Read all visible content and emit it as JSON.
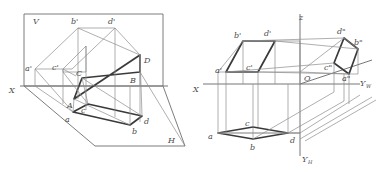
{
  "figure": {
    "type": "engineering-projection-drawing",
    "panels": [
      {
        "id": "left",
        "name": "pictorial-two-plane-projection",
        "description": "Pictorial view of the V (frontal) and H (horizontal) projection planes with the spatial quadrilateral and its projections",
        "plane_labels": [
          {
            "id": "V",
            "text": "V",
            "x": 33,
            "y": 20
          },
          {
            "id": "H",
            "text": "H",
            "x": 170,
            "y": 140
          },
          {
            "id": "X",
            "text": "X",
            "x": 11,
            "y": 90
          }
        ],
        "points": [
          {
            "id": "a-prime",
            "text": "a'",
            "x": 28,
            "y": 68
          },
          {
            "id": "b-prime",
            "text": "b'",
            "x": 74,
            "y": 21
          },
          {
            "id": "c-prime",
            "text": "c'",
            "x": 55,
            "y": 67
          },
          {
            "id": "d-prime",
            "text": "d'",
            "x": 110,
            "y": 21
          },
          {
            "id": "A",
            "text": "A",
            "x": 69,
            "y": 105
          },
          {
            "id": "B",
            "text": "B",
            "x": 130,
            "y": 80
          },
          {
            "id": "C",
            "text": "C",
            "x": 77,
            "y": 72
          },
          {
            "id": "D",
            "text": "D",
            "x": 144,
            "y": 60
          },
          {
            "id": "a",
            "text": "a",
            "x": 67,
            "y": 119
          },
          {
            "id": "b",
            "text": "b",
            "x": 134,
            "y": 131
          },
          {
            "id": "c",
            "text": "c",
            "x": 83,
            "y": 110
          },
          {
            "id": "d",
            "text": "d",
            "x": 146,
            "y": 121
          }
        ]
      },
      {
        "id": "right",
        "name": "three-axis-projection",
        "description": "Three-projection axis system with V, H and W planes showing all three views of the quadrilateral",
        "axis_labels": [
          {
            "id": "Z",
            "text": "z",
            "x": 301,
            "y": 17
          },
          {
            "id": "X",
            "text": "X",
            "x": 195,
            "y": 89
          },
          {
            "id": "O",
            "text": "O",
            "x": 305,
            "y": 82
          },
          {
            "id": "Yw",
            "text": "Y",
            "sub": "W",
            "x": 362,
            "y": 86
          },
          {
            "id": "Yh",
            "text": "Y",
            "sub": "H",
            "x": 303,
            "y": 159
          }
        ],
        "points": [
          {
            "id": "a-prime",
            "text": "a'",
            "x": 219,
            "y": 70
          },
          {
            "id": "b-prime",
            "text": "b'",
            "x": 237,
            "y": 35
          },
          {
            "id": "c-prime",
            "text": "c'",
            "x": 249,
            "y": 68
          },
          {
            "id": "d-prime",
            "text": "d'",
            "x": 266,
            "y": 33
          },
          {
            "id": "a-dblprime",
            "text": "a\"",
            "x": 345,
            "y": 79
          },
          {
            "id": "b-dblprime",
            "text": "b\"",
            "x": 356,
            "y": 42
          },
          {
            "id": "c-dblprime",
            "text": "c\"",
            "x": 327,
            "y": 67
          },
          {
            "id": "d-dblprime",
            "text": "d\"",
            "x": 340,
            "y": 31
          },
          {
            "id": "a",
            "text": "a",
            "x": 210,
            "y": 136
          },
          {
            "id": "b",
            "text": "b",
            "x": 262,
            "y": 147
          },
          {
            "id": "c",
            "text": "c",
            "x": 247,
            "y": 123
          },
          {
            "id": "d",
            "text": "d",
            "x": 292,
            "y": 140
          }
        ]
      }
    ]
  }
}
